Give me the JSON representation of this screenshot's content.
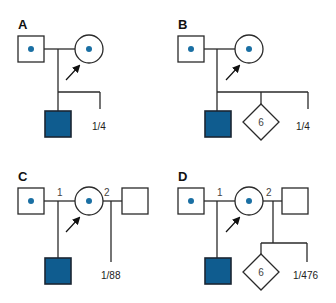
{
  "colors": {
    "affected_fill": "#0f5c8f",
    "carrier_dot": "#1a6fa3",
    "line": "#2a2a2a"
  },
  "panels": [
    {
      "label": "A",
      "probability": "1/4",
      "partners": [],
      "unborn_count": null
    },
    {
      "label": "B",
      "probability": "1/4",
      "partners": [],
      "unborn_count": "6"
    },
    {
      "label": "C",
      "probability": "1/88",
      "partners": [
        "1",
        "2"
      ],
      "unborn_count": null
    },
    {
      "label": "D",
      "probability": "1/476",
      "partners": [
        "1",
        "2"
      ],
      "unborn_count": "6"
    }
  ],
  "legend": {
    "carrier": "dot-in-symbol (heterozygous carrier)",
    "affected": "filled square (affected male)",
    "proband_arrow": "arrow points to consultand"
  }
}
